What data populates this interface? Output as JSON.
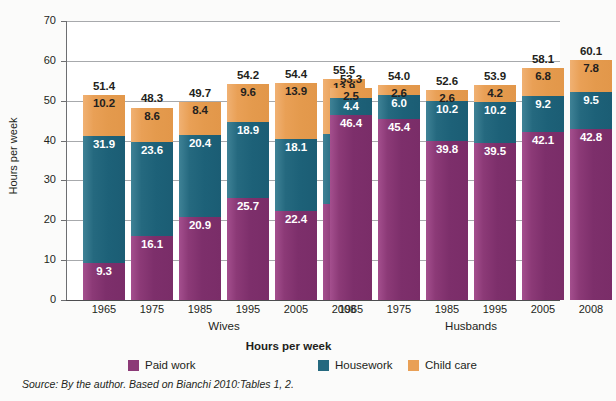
{
  "chart_data": {
    "type": "bar",
    "subtype": "stacked-bar",
    "title": "",
    "xlabel": "",
    "ylabel": "Hours per week",
    "ylim": [
      0,
      70
    ],
    "yticks": [
      0,
      10,
      20,
      30,
      40,
      50,
      60,
      70
    ],
    "ytick_labels": [
      "0",
      "10",
      "20",
      "30",
      "40",
      "50",
      "60",
      "70"
    ],
    "grid": "horizontal",
    "legend_title": "Hours per week",
    "legend_position": "bottom",
    "groups": [
      {
        "name": "Wives",
        "categories": [
          "1965",
          "1975",
          "1985",
          "1995",
          "2005",
          "2008"
        ],
        "totals": [
          "51.4",
          "48.3",
          "49.7",
          "54.2",
          "54.4",
          "55.5"
        ],
        "series": [
          {
            "name": "Paid work",
            "values": [
              "9.3",
              "16.1",
              "20.9",
              "25.7",
              "22.4",
              "24.2"
            ]
          },
          {
            "name": "Housework",
            "values": [
              "31.9",
              "23.6",
              "20.4",
              "18.9",
              "18.1",
              "17.4"
            ]
          },
          {
            "name": "Child care",
            "values": [
              "10.2",
              "8.6",
              "8.4",
              "9.6",
              "13.9",
              "13.9"
            ]
          }
        ]
      },
      {
        "name": "Husbands",
        "categories": [
          "1965",
          "1975",
          "1985",
          "1995",
          "2005",
          "2008"
        ],
        "totals": [
          "53.3",
          "54.0",
          "52.6",
          "53.9",
          "58.1",
          "60.1"
        ],
        "series": [
          {
            "name": "Paid work",
            "values": [
              "46.4",
              "45.4",
              "39.8",
              "39.5",
              "42.1",
              "42.8"
            ]
          },
          {
            "name": "Housework",
            "values": [
              "4.4",
              "6.0",
              "10.2",
              "10.2",
              "9.2",
              "9.5"
            ]
          },
          {
            "name": "Child care",
            "values": [
              "2.5",
              "2.6",
              "2.6",
              "4.2",
              "6.8",
              "7.8"
            ]
          }
        ]
      }
    ],
    "legend": [
      {
        "label": "Paid work",
        "color": "#8c3a77"
      },
      {
        "label": "Housework",
        "color": "#25697f"
      },
      {
        "label": "Child care",
        "color": "#e9a056"
      }
    ],
    "colors": {
      "paid_work": "#8c3a77",
      "housework": "#25697f",
      "child_care": "#e9a056",
      "gridline": "#a7a9ac",
      "axis": "#4d4d4f",
      "background": "#fbfbfa",
      "plot_background": "#ffffff"
    },
    "source_note": "Source: By the author. Based on Bianchi 2010:Tables 1, 2."
  }
}
